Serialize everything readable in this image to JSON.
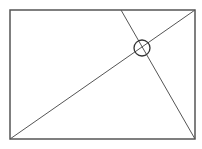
{
  "diagram": {
    "width": 202,
    "height": 149,
    "background": "#ffffff",
    "stroke_color": "#555555",
    "rectangle": {
      "x": 10,
      "y": 10,
      "width": 185,
      "height": 129,
      "stroke_width": 1.5
    },
    "lines": [
      {
        "name": "diagonal-bottom-left-to-top-right",
        "x1": 10,
        "y1": 139,
        "x2": 195,
        "y2": 10
      },
      {
        "name": "line-top-to-bottom-right",
        "x1": 121,
        "y1": 10,
        "x2": 195,
        "y2": 139
      }
    ],
    "intersection_marker": {
      "cx": 142,
      "cy": 48,
      "r": 8
    }
  }
}
